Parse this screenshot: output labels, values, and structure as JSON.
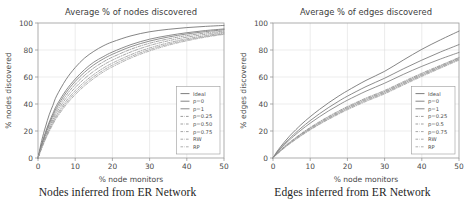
{
  "figure": {
    "panels": [
      {
        "id": "nodes",
        "caption": "Nodes inferred from ER Network",
        "chart_data": {
          "type": "line",
          "title": "Average % of nodes discovered",
          "xlabel": "% node monitors",
          "ylabel": "% nodes discovered",
          "xlim": [
            0,
            50
          ],
          "ylim": [
            0,
            100
          ],
          "xticks": [
            0,
            10,
            20,
            30,
            40,
            50
          ],
          "yticks": [
            0,
            20,
            40,
            60,
            80,
            100
          ],
          "grid": true,
          "legend_position": "lower right",
          "x": [
            0,
            1,
            2,
            3,
            4,
            5,
            7.5,
            10,
            12.5,
            15,
            17.5,
            20,
            25,
            30,
            35,
            40,
            45,
            50
          ],
          "series": [
            {
              "name": "Ideal",
              "style": "solid",
              "color": "#6f6f6f",
              "values": [
                0,
                13,
                23,
                32,
                39,
                46,
                58,
                67,
                74,
                79,
                83,
                86,
                90.5,
                93.5,
                95.3,
                96.6,
                97.5,
                98.2
              ]
            },
            {
              "name": "p=0",
              "style": "solid",
              "color": "#777777",
              "values": [
                0,
                10.5,
                19,
                26.5,
                33,
                39,
                50,
                58.5,
                65.5,
                71,
                75,
                78.5,
                84,
                88,
                90.7,
                92.8,
                94.4,
                95.6
              ]
            },
            {
              "name": "p=1",
              "style": "solid",
              "color": "#7d7d7d",
              "values": [
                0,
                9.8,
                18,
                25.2,
                31.5,
                37.3,
                48.2,
                56.7,
                63.5,
                69,
                73.3,
                76.8,
                82.5,
                86.6,
                89.6,
                91.9,
                93.6,
                95.0
              ]
            },
            {
              "name": "p=0.25",
              "style": "dashdot",
              "color": "#8a8a8a",
              "values": [
                0,
                9.2,
                17,
                24,
                30,
                35.6,
                46.2,
                54.5,
                61.2,
                66.7,
                71.1,
                74.7,
                80.6,
                85.0,
                88.2,
                90.7,
                92.6,
                94.1
              ]
            },
            {
              "name": "p=0.50",
              "style": "dashdot",
              "color": "#909090",
              "values": [
                0,
                8.6,
                16,
                22.6,
                28.4,
                33.8,
                44.1,
                52.2,
                58.8,
                64.3,
                68.8,
                72.5,
                78.6,
                83.3,
                86.8,
                89.5,
                91.6,
                93.3
              ]
            },
            {
              "name": "p=0.75",
              "style": "dashdot",
              "color": "#969696",
              "values": [
                0,
                8.0,
                15,
                21.3,
                26.9,
                32.0,
                42.0,
                49.9,
                56.4,
                61.9,
                66.5,
                70.3,
                76.6,
                81.5,
                85.3,
                88.3,
                90.6,
                92.5
              ]
            },
            {
              "name": "RW",
              "style": "dashdot",
              "color": "#9b9b9b",
              "values": [
                0,
                7.6,
                14.3,
                20.4,
                25.8,
                30.8,
                40.5,
                48.3,
                54.8,
                60.3,
                64.9,
                68.8,
                75.2,
                80.3,
                84.3,
                87.5,
                90.0,
                92.0
              ]
            },
            {
              "name": "RP",
              "style": "dashdot",
              "color": "#a0a0a0",
              "values": [
                0,
                7.2,
                13.7,
                19.6,
                24.9,
                29.7,
                39.2,
                46.9,
                53.4,
                58.9,
                63.6,
                67.5,
                74.1,
                79.3,
                83.5,
                86.8,
                89.5,
                91.6
              ]
            }
          ]
        }
      },
      {
        "id": "edges",
        "caption": "Edges inferred from ER Network",
        "chart_data": {
          "type": "line",
          "title": "Average % of edges discovered",
          "xlabel": "% node monitors",
          "ylabel": "% edges discovered",
          "xlim": [
            0,
            50
          ],
          "ylim": [
            0,
            100
          ],
          "xticks": [
            0,
            10,
            20,
            30,
            40,
            50
          ],
          "yticks": [
            0,
            20,
            40,
            60,
            80,
            100
          ],
          "grid": true,
          "legend_position": "lower right",
          "x": [
            0,
            1,
            2,
            3,
            4,
            5,
            7.5,
            10,
            12.5,
            15,
            17.5,
            20,
            25,
            30,
            35,
            40,
            45,
            50
          ],
          "series": [
            {
              "name": "Ideal",
              "style": "solid",
              "color": "#6f6f6f",
              "values": [
                0,
                4.5,
                8.2,
                11.6,
                14.8,
                17.8,
                24.6,
                30.6,
                36.0,
                41.0,
                45.6,
                49.8,
                57.5,
                64.2,
                72.5,
                80.5,
                87.5,
                94.0
              ]
            },
            {
              "name": "p=0",
              "style": "solid",
              "color": "#787878",
              "values": [
                0,
                3.9,
                7.2,
                10.3,
                13.2,
                15.9,
                22.1,
                27.7,
                32.8,
                37.5,
                41.8,
                45.8,
                52.9,
                59.1,
                66.0,
                72.5,
                78.5,
                84.0
              ]
            },
            {
              "name": "p=1",
              "style": "solid",
              "color": "#7e7e7e",
              "values": [
                0,
                3.6,
                6.7,
                9.6,
                12.3,
                14.8,
                20.6,
                25.8,
                30.6,
                35.0,
                39.0,
                42.8,
                49.5,
                55.4,
                61.9,
                67.9,
                73.3,
                78.2
              ]
            },
            {
              "name": "p=0.25",
              "style": "dashdot",
              "color": "#8b8b8b",
              "values": [
                0,
                3.0,
                5.7,
                8.2,
                10.6,
                12.8,
                17.9,
                22.6,
                26.9,
                30.9,
                34.6,
                38.1,
                44.4,
                50.0,
                56.5,
                62.8,
                68.6,
                74.5
              ]
            },
            {
              "name": "p=0.5",
              "style": "dashdot",
              "color": "#919191",
              "values": [
                0,
                2.9,
                5.5,
                8.0,
                10.3,
                12.5,
                17.5,
                22.1,
                26.3,
                30.3,
                33.9,
                37.4,
                43.7,
                49.3,
                55.8,
                62.1,
                68.0,
                74.0
              ]
            },
            {
              "name": "p=0.75",
              "style": "dashdot",
              "color": "#979797",
              "values": [
                0,
                2.8,
                5.3,
                7.7,
                10.0,
                12.1,
                17.1,
                21.6,
                25.8,
                29.7,
                33.3,
                36.8,
                43.1,
                48.7,
                55.2,
                61.5,
                67.5,
                73.5
              ]
            },
            {
              "name": "RW",
              "style": "dashdot",
              "color": "#9c9c9c",
              "values": [
                0,
                2.7,
                5.2,
                7.5,
                9.7,
                11.8,
                16.7,
                21.2,
                25.3,
                29.2,
                32.8,
                36.3,
                42.5,
                48.1,
                54.6,
                61.0,
                67.0,
                73.0
              ]
            },
            {
              "name": "RP",
              "style": "dashdot",
              "color": "#a1a1a1",
              "values": [
                0,
                2.6,
                5.0,
                7.3,
                9.5,
                11.5,
                16.3,
                20.8,
                24.9,
                28.7,
                32.3,
                35.7,
                41.9,
                47.5,
                54.0,
                60.4,
                66.5,
                72.5
              ]
            }
          ]
        }
      }
    ]
  }
}
